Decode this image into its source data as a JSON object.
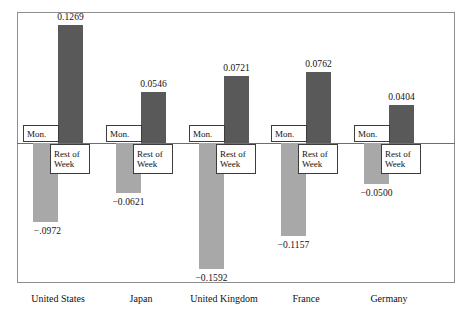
{
  "chart_data": {
    "type": "bar",
    "title": "",
    "subtitle": "",
    "xlabel": "",
    "ylabel": "",
    "grid": false,
    "legend_position": "in-plot-boxes",
    "ylim": [
      -0.18,
      0.14
    ],
    "zero_line": 0,
    "categories": [
      "United States",
      "Japan",
      "United Kingdom",
      "France",
      "Germany"
    ],
    "series": [
      {
        "name": "Mon.",
        "color": "#a8a8a8",
        "values": [
          -0.0972,
          -0.0621,
          -0.1592,
          -0.1157,
          -0.05
        ],
        "value_labels": [
          "−.0972",
          "−0.0621",
          "−0.1592",
          "−0.1157",
          "−0.0500"
        ]
      },
      {
        "name": "Rest of Week",
        "color": "#595959",
        "values": [
          0.1269,
          0.0546,
          0.0721,
          0.0762,
          0.0404
        ],
        "value_labels": [
          "0.1269",
          "0.0546",
          "0.0721",
          "0.0762",
          "0.0404"
        ]
      }
    ]
  },
  "plot": {
    "frame_color": "#8e8e8e",
    "axis_color": "#6e6e6e",
    "background": "#ffffff"
  },
  "tags": {
    "mon_label": "Mon.",
    "rest_line1": "Rest of",
    "rest_line2": "Week"
  }
}
